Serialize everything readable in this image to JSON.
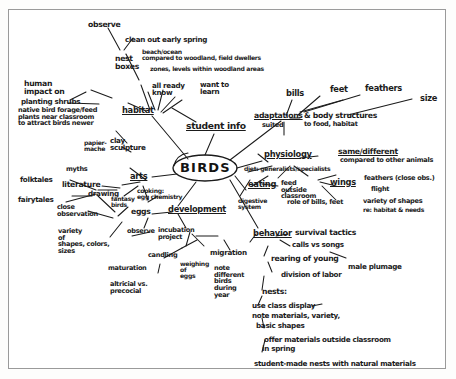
{
  "document": {
    "type": "hand-drawn-mind-map",
    "medium": "pen on paper, photocopied",
    "center_topic": "BIRDS",
    "ink_color": "#1b1b1b",
    "paper_color": "#ffffff",
    "border_color": "#9a9a9a"
  },
  "center": {
    "label": "BIRDS"
  },
  "branches": {
    "student_info": {
      "label": "student info",
      "children": [
        {
          "label": "all ready\nknow"
        },
        {
          "label": "want to\nlearn"
        }
      ]
    },
    "habitat": {
      "label": "habitat",
      "children": [
        {
          "label": "nest\nboxes"
        },
        {
          "label": "observe"
        },
        {
          "label": "clean out early spring"
        },
        {
          "label": "human\nimpact on"
        },
        {
          "label": "planting shrubs"
        },
        {
          "label": "native bird forage/feed\nplants near classroom\nto attract birds newer"
        },
        {
          "label": "beach/ocean\ncompared to woodland, field dwellers"
        },
        {
          "label": "zones, levels within woodland areas"
        }
      ]
    },
    "arts": {
      "label": "arts",
      "children": [
        {
          "label": "clay\nsculpture"
        },
        {
          "label": "papier-\nmache"
        },
        {
          "label": "literature"
        },
        {
          "label": "myths"
        },
        {
          "label": "folktales"
        },
        {
          "label": "fairytales"
        },
        {
          "label": "drawing"
        },
        {
          "label": "fantasy\nbirds"
        },
        {
          "label": "cooking:\negg chemistry"
        }
      ]
    },
    "development": {
      "label": "development",
      "children": [
        {
          "label": "eggs"
        },
        {
          "label": "observe"
        },
        {
          "label": "close\nobservation"
        },
        {
          "label": "variety\nof\nshapes, colors,\nsizes"
        },
        {
          "label": "incubation\nproject"
        },
        {
          "label": "candling"
        },
        {
          "label": "weighing\nof\neggs"
        },
        {
          "label": "maturation"
        },
        {
          "label": "altricial vs.\nprecocial"
        },
        {
          "label": "migration"
        },
        {
          "label": "note\ndifferent\nbirds\nduring\nyear"
        }
      ]
    },
    "adaptations": {
      "label": "adaptations",
      "tail": "& body structures",
      "children": [
        {
          "label": "suited"
        },
        {
          "label": "to food, habitat"
        },
        {
          "label": "bills"
        },
        {
          "label": "feet"
        },
        {
          "label": "feathers"
        },
        {
          "label": "size"
        }
      ]
    },
    "physiology": {
      "label": "physiology",
      "children": [
        {
          "label": "same/different"
        },
        {
          "label": "compared to other animals"
        },
        {
          "label": "diet: generalists/specialists"
        },
        {
          "label": "eating"
        },
        {
          "label": "feed\noutside\nclassroom"
        },
        {
          "label": "digestive\nsystem"
        },
        {
          "label": "role of bills, feet"
        },
        {
          "label": "wings"
        },
        {
          "label": "feathers (close obs.)"
        },
        {
          "label": "flight"
        },
        {
          "label": "variety of shapes"
        },
        {
          "label": "re: habitat & needs"
        }
      ]
    },
    "behavior": {
      "label": "behavior",
      "children": [
        {
          "label": "survival tactics"
        },
        {
          "label": "calls vs songs"
        },
        {
          "label": "rearing of young"
        },
        {
          "label": "male plumage"
        },
        {
          "label": "division of labor"
        }
      ]
    },
    "nests": {
      "label": "nests:",
      "children": [
        {
          "label": "use class display"
        },
        {
          "label": "note materials, variety,"
        },
        {
          "label": "basic shapes"
        },
        {
          "label": "offer materials outside classroom"
        },
        {
          "label": "in spring"
        },
        {
          "label": "student-made nests with natural materials"
        }
      ]
    }
  }
}
